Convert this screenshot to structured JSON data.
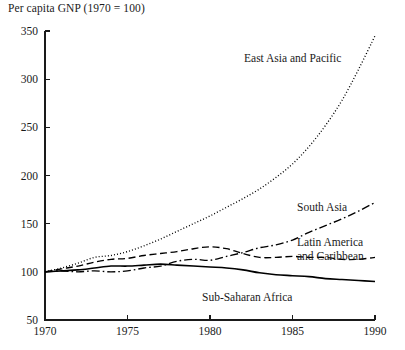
{
  "chart_data": {
    "type": "line",
    "title": "Per capita GNP (1970 = 100)",
    "xlabel": "",
    "ylabel": "",
    "xlim": [
      1970,
      1990
    ],
    "ylim": [
      50,
      350
    ],
    "ytick_step": 50,
    "xtick_step": 5,
    "grid": false,
    "legend_position": "inline-annotations",
    "x": [
      1970,
      1971,
      1972,
      1973,
      1974,
      1975,
      1976,
      1977,
      1978,
      1979,
      1980,
      1981,
      1982,
      1983,
      1984,
      1985,
      1986,
      1987,
      1988,
      1989,
      1990
    ],
    "xticks": [
      1970,
      1975,
      1980,
      1985,
      1990
    ],
    "xtick_labels": [
      "1970",
      "1975",
      "1980",
      "1985",
      "1990"
    ],
    "yticks": [
      50,
      100,
      150,
      200,
      250,
      300,
      350
    ],
    "ytick_labels": [
      "50",
      "100",
      "150",
      "200",
      "250",
      "300",
      "350"
    ],
    "series": [
      {
        "name": "East Asia and Pacific",
        "style": "dotted",
        "label": "East Asia and Pacific",
        "label_x": 244,
        "label_y": 62,
        "values": [
          100,
          104,
          109,
          115,
          117,
          121,
          127,
          134,
          142,
          150,
          158,
          167,
          176,
          186,
          198,
          212,
          230,
          252,
          278,
          310,
          345
        ]
      },
      {
        "name": "South Asia",
        "style": "dash-dot",
        "label": "South Asia",
        "label_x": 297,
        "label_y": 211,
        "values": [
          100,
          101,
          100,
          101,
          100,
          101,
          104,
          106,
          111,
          113,
          112,
          116,
          120,
          125,
          128,
          133,
          141,
          148,
          155,
          163,
          172
        ]
      },
      {
        "name": "Latin America and Caribbean",
        "style": "dashed",
        "label": "Latin America\nand Caribbean",
        "label_line_1": "Latin America",
        "label_line_2": "and Caribbean",
        "label_x": 297,
        "label_y": 246,
        "values": [
          100,
          103,
          106,
          110,
          113,
          114,
          117,
          119,
          121,
          124,
          126,
          124,
          119,
          115,
          115,
          116,
          115,
          115,
          113,
          113,
          115
        ]
      },
      {
        "name": "Sub-Saharan Africa",
        "style": "solid",
        "label": "Sub-Saharan Africa",
        "label_x": 202,
        "label_y": 301,
        "values": [
          100,
          101,
          102,
          104,
          106,
          106,
          107,
          108,
          107,
          106,
          105,
          104,
          102,
          99,
          97,
          96,
          95,
          93,
          92,
          91,
          90
        ]
      }
    ]
  },
  "axes": {
    "title": "Per capita GNP (1970 = 100)"
  }
}
